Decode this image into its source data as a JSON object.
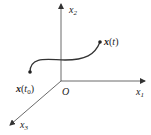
{
  "diagram": {
    "type": "3d-coordinate-trajectory",
    "axes": {
      "x1": {
        "label": "x",
        "subscript": "1"
      },
      "x2": {
        "label": "x",
        "subscript": "2"
      },
      "x3": {
        "label": "x",
        "subscript": "3"
      }
    },
    "origin_label": "O",
    "curve": {
      "start_label": {
        "main": "x",
        "paren_open": "(",
        "t": "t",
        "t_sub": "0",
        "paren_close": ")"
      },
      "end_label": {
        "main": "x",
        "paren_open": "(",
        "t": "t",
        "paren_close": ")"
      }
    },
    "colors": {
      "stroke": "#333333",
      "text": "#222222"
    }
  }
}
